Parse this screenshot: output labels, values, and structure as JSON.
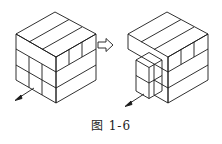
{
  "figure": {
    "caption": "图 1-6",
    "left_diagram": "cube assembled from 3 layers of rectangular blocks, front-left corner blocks to be removed (arrow)",
    "right_diagram": "same cube with front corner blocks pulled out",
    "transition_icon": "hollow-right-arrow-icon",
    "line_color": "#1a1a1a"
  }
}
